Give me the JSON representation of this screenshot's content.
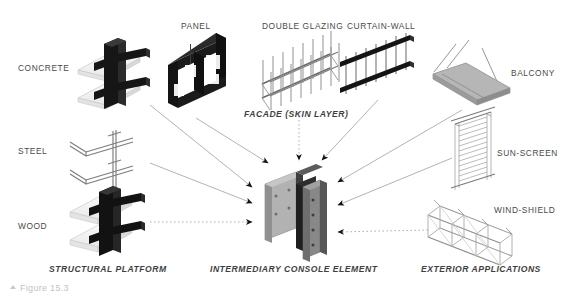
{
  "figure": {
    "caption": "Figure 15.3",
    "marker_icon": "triangle-up-icon"
  },
  "labels": {
    "concrete": "CONCRETE",
    "steel": "STEEL",
    "wood": "WOOD",
    "panel": "PANEL",
    "double_glazing": "DOUBLE GLAZING",
    "curtain_wall": "CURTAIN-WALL",
    "balcony": "BALCONY",
    "sun_screen": "SUN-SCREEN",
    "wind_shield": "WIND-SHIELD"
  },
  "group_labels": {
    "structural_platform": "STRUCTURAL PLATFORM",
    "facade": "FACADE (SKIN LAYER)",
    "intermediary": "INTERMEDIARY CONSOLE ELEMENT",
    "exterior": "EXTERIOR APPLICATIONS"
  },
  "colors": {
    "background": "#ffffff",
    "ink_dark": "#1a1a1a",
    "ink_mid": "#6e6e6e",
    "ink_light": "#bdbdbd",
    "slab_fill": "#f2f2f2",
    "console_face": "#9a9a9a",
    "console_side": "#4a4a4a",
    "label_text": "#4a4a4a",
    "caption_text": "#c3c3c3"
  },
  "diagram": {
    "type": "exploded-axonometric-assembly",
    "hub": "intermediary-console-element",
    "arrow_sources": [
      "concrete",
      "steel",
      "wood",
      "panel",
      "double-glazing",
      "curtain-wall",
      "balcony",
      "sun-screen",
      "wind-shield"
    ]
  }
}
